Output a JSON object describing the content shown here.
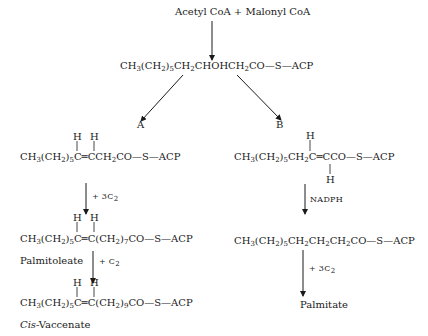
{
  "diagram": {
    "start": "Acetyl CoA + Malonyl CoA",
    "intermediate": {
      "parts": [
        "CH",
        "3",
        "(CH",
        "2",
        ")",
        "5",
        "CH",
        "2",
        "CHOHCH",
        "2",
        "CO—S—ACP"
      ]
    },
    "branch_labels": {
      "a": "A",
      "b": "B"
    },
    "pathway_a": {
      "step1": {
        "h_labels": [
          "H",
          "H"
        ],
        "parts": [
          "CH",
          "3",
          "(CH",
          "2",
          ")",
          "5",
          "C═CCH",
          "2",
          "CO—S—ACP"
        ]
      },
      "arrow1_label": "+ 3C",
      "arrow1_label_sub": "2",
      "step2": {
        "h_labels": [
          "H",
          "H"
        ],
        "parts": [
          "CH",
          "3",
          "(CH",
          "2",
          ")",
          "5",
          "C═C(CH",
          "2",
          ")",
          "7",
          "CO—S—ACP"
        ]
      },
      "step2_name": "Palmitoleate",
      "arrow2_label": "+ C",
      "arrow2_label_sub": "2",
      "step3": {
        "h_labels": [
          "H",
          "H"
        ],
        "parts": [
          "CH",
          "3",
          "(CH",
          "2",
          ")",
          "5",
          "C═C(CH",
          "2",
          ")",
          "9",
          "CO—S—ACP"
        ]
      },
      "step3_name_italic": "Cis",
      "step3_name_rest": "-Vaccenate"
    },
    "pathway_b": {
      "step1": {
        "h_top": "H",
        "h_bottom": "H",
        "parts": [
          "CH",
          "3",
          "(CH",
          "2",
          ")",
          "5",
          "CH",
          "2",
          "C═CCO—S—ACP"
        ]
      },
      "arrow1_label": "NADPH",
      "step2": {
        "parts": [
          "CH",
          "3",
          "(CH",
          "2",
          ")",
          "5",
          "CH",
          "2",
          "CH",
          "2",
          "CH",
          "2",
          "CO—S—ACP"
        ]
      },
      "arrow2_label": "+ 3C",
      "arrow2_label_sub": "2",
      "step3_name": "Palmitate"
    }
  }
}
